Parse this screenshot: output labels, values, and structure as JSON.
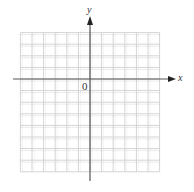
{
  "figure": {
    "type": "coordinate-plane",
    "x_axis_label": "x",
    "y_axis_label": "y",
    "origin_label": "0",
    "grid": {
      "columns": 12,
      "rows": 12,
      "columns_left_of_y_axis": 6,
      "columns_right_of_y_axis": 6,
      "rows_above_x_axis": 4,
      "rows_below_x_axis": 8
    },
    "colors": {
      "grid_line": "#d4d4d4",
      "grid_dot": "#bdbdbd",
      "axis": "#555555",
      "label": "#333333"
    }
  }
}
